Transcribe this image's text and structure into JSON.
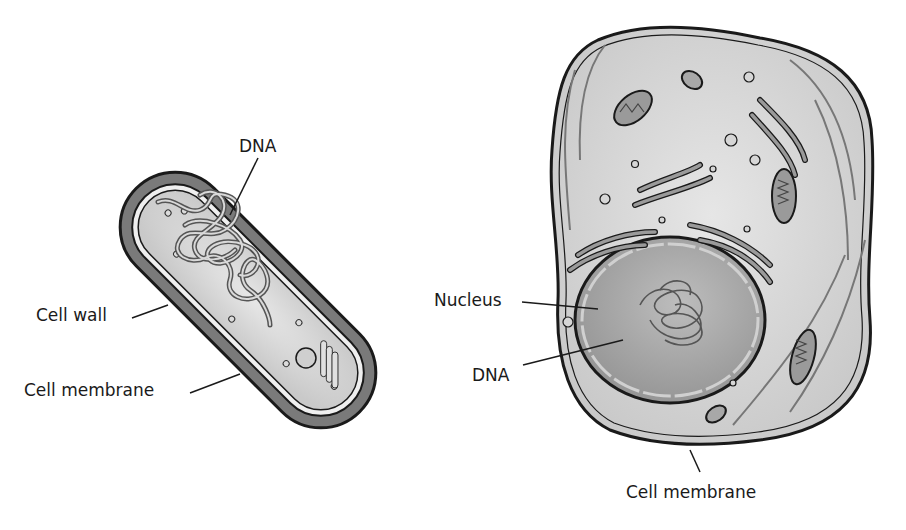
{
  "diagram": {
    "type": "cell-comparison",
    "prokaryote": {
      "labels": {
        "dna": "DNA",
        "cell_wall": "Cell wall",
        "cell_membrane": "Cell membrane"
      }
    },
    "eukaryote": {
      "labels": {
        "nucleus": "Nucleus",
        "dna": "DNA",
        "cell_membrane": "Cell membrane"
      }
    },
    "colors": {
      "cell_wall": "#7a7a7a",
      "outline": "#1a1a1a",
      "cytoplasm": "#d6d6d6",
      "nucleus": "#a8a8a8",
      "organelle": "#9a9a9a",
      "background": "#ffffff"
    }
  }
}
